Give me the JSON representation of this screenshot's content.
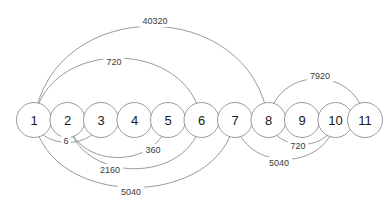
{
  "chart_data": {
    "type": "diagram",
    "diagram_kind": "arc-diagram",
    "title": "",
    "xlabel": "",
    "ylabel": "",
    "colors": {
      "background": "#ffffff",
      "stroke": "#8f8f8f",
      "node_fill": "#ffffff",
      "node_text": "#1a1a1a",
      "edge_text": "#3a3a3a"
    },
    "layout": {
      "baseline_y": 120,
      "node_radius": 17.5,
      "node_spacing": 33.5,
      "first_node_x": 34
    },
    "nodes": [
      {
        "id": 1,
        "label": "1",
        "x": 34.0
      },
      {
        "id": 2,
        "label": "2",
        "x": 67.5
      },
      {
        "id": 3,
        "label": "3",
        "x": 101.0
      },
      {
        "id": 4,
        "label": "4",
        "x": 134.5
      },
      {
        "id": 5,
        "label": "5",
        "x": 168.0
      },
      {
        "id": 6,
        "label": "6",
        "x": 201.5
      },
      {
        "id": 7,
        "label": "7",
        "x": 235.0
      },
      {
        "id": 8,
        "label": "8",
        "x": 268.5
      },
      {
        "id": 9,
        "label": "9",
        "x": 302.0
      },
      {
        "id": 10,
        "label": "10",
        "x": 335.5
      },
      {
        "id": 11,
        "label": "11",
        "x": 365.0
      }
    ],
    "edges": [
      {
        "source": 1,
        "target": 8,
        "label": "40320",
        "side": "above",
        "height": 100,
        "label_x": 155,
        "label_y": 21
      },
      {
        "source": 1,
        "target": 6,
        "label": "720",
        "side": "above",
        "height": 66,
        "label_x": 114,
        "label_y": 62
      },
      {
        "source": 8,
        "target": 11,
        "label": "7920",
        "side": "above",
        "height": 44,
        "label_x": 320,
        "label_y": 76
      },
      {
        "source": 1,
        "target": 3,
        "label": "6",
        "side": "below",
        "height": 24,
        "label_x": 66,
        "label_y": 141
      },
      {
        "source": 2,
        "target": 5,
        "label": "360",
        "side": "below",
        "height": 40,
        "label_x": 153,
        "label_y": 150
      },
      {
        "source": 2,
        "target": 6,
        "label": "2160",
        "side": "below",
        "height": 52,
        "label_x": 110,
        "label_y": 170
      },
      {
        "source": 1,
        "target": 7,
        "label": "5040",
        "side": "below",
        "height": 72,
        "label_x": 131,
        "label_y": 192
      },
      {
        "source": 8,
        "target": 10,
        "label": "720",
        "side": "below",
        "height": 26,
        "label_x": 298,
        "label_y": 146
      },
      {
        "source": 7,
        "target": 10,
        "label": "5040",
        "side": "below",
        "height": 42,
        "label_x": 279,
        "label_y": 163
      }
    ],
    "edge_values": [
      40320,
      720,
      7920,
      6,
      360,
      2160,
      5040,
      720,
      5040
    ],
    "node_labels": [
      "1",
      "2",
      "3",
      "4",
      "5",
      "6",
      "7",
      "8",
      "9",
      "10",
      "11"
    ]
  }
}
